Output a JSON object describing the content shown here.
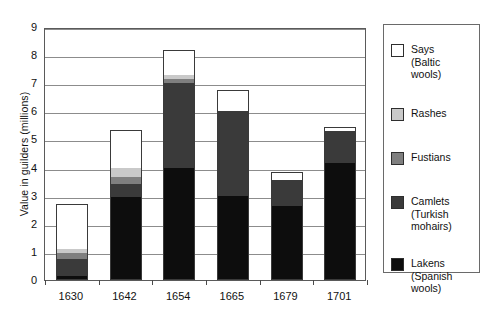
{
  "chart_data": {
    "type": "bar",
    "subtype": "stacked-bar",
    "title": "",
    "xlabel": "",
    "ylabel": "Value in guilders (millions)",
    "categories": [
      "1630",
      "1642",
      "1654",
      "1665",
      "1679",
      "1701"
    ],
    "ylim": [
      0,
      9
    ],
    "yticks": [
      0,
      1,
      2,
      3,
      4,
      5,
      6,
      7,
      8,
      9
    ],
    "ytick_labels": [
      "0",
      "1",
      "2",
      "3",
      "4",
      "5",
      "6",
      "7",
      "8",
      "9"
    ],
    "grid": true,
    "grid_axis": "y",
    "legend_position": "right-outside",
    "stack_order_bottom_to_top": [
      "Lakens (Spanish wools)",
      "Camlets (Turkish mohairs)",
      "Fustians",
      "Rashes",
      "Says (Baltic wools)"
    ],
    "series": [
      {
        "name": "Lakens (Spanish wools)",
        "short_name": "Lakens",
        "qualifier": "(Spanish wools)",
        "color": "#0d0d0d",
        "values": [
          0.15,
          2.95,
          4.0,
          3.0,
          2.65,
          4.15
        ]
      },
      {
        "name": "Camlets (Turkish mohairs)",
        "short_name": "Camlets",
        "qualifier": "(Turkish mohairs)",
        "color": "#3a3a3a",
        "values": [
          0.6,
          0.45,
          3.0,
          3.0,
          0.9,
          1.15
        ]
      },
      {
        "name": "Fustians",
        "short_name": "Fustians",
        "qualifier": "",
        "color": "#7f7f7f",
        "values": [
          0.2,
          0.25,
          0.15,
          0.0,
          0.0,
          0.0
        ]
      },
      {
        "name": "Rashes",
        "short_name": "Rashes",
        "qualifier": "",
        "color": "#c9c9c9",
        "values": [
          0.15,
          0.35,
          0.15,
          0.0,
          0.0,
          0.0
        ]
      },
      {
        "name": "Says (Baltic wools)",
        "short_name": "Says",
        "qualifier": "(Baltic wools)",
        "color": "#ffffff",
        "values": [
          1.6,
          1.35,
          0.9,
          0.75,
          0.3,
          0.15
        ]
      }
    ],
    "totals": [
      2.7,
      5.35,
      8.2,
      6.75,
      3.85,
      5.45
    ]
  },
  "legend": {
    "items": [
      {
        "label": "Says\n(Baltic\nwools)",
        "swatch": "#ffffff"
      },
      {
        "label": "Rashes",
        "swatch": "#c9c9c9"
      },
      {
        "label": "Fustians",
        "swatch": "#7f7f7f"
      },
      {
        "label": "Camlets\n(Turkish\nmohairs)",
        "swatch": "#3a3a3a"
      },
      {
        "label": "Lakens\n(Spanish\nwools)",
        "swatch": "#0d0d0d"
      }
    ]
  }
}
